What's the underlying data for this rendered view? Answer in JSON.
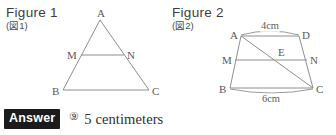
{
  "figures": [
    {
      "id": "figure-1",
      "title": "Figure 1",
      "subtitle": "(図1)",
      "shape": "triangle",
      "points": [
        {
          "name": "A",
          "label": "A",
          "x": 100,
          "y": 20,
          "label_dx": -3,
          "label_dy": -12
        },
        {
          "name": "B",
          "label": "B",
          "x": 63,
          "y": 90,
          "label_dx": -11,
          "label_dy": -4
        },
        {
          "name": "C",
          "label": "C",
          "x": 149,
          "y": 90,
          "label_dx": 3,
          "label_dy": -4
        },
        {
          "name": "M",
          "label": "M",
          "x": 81,
          "y": 55,
          "label_dx": -14,
          "label_dy": -5
        },
        {
          "name": "N",
          "label": "N",
          "x": 124,
          "y": 55,
          "label_dx": 3,
          "label_dy": -5
        }
      ],
      "segments": [
        {
          "name": "side-AB",
          "from": "A",
          "to": "B"
        },
        {
          "name": "side-AC",
          "from": "A",
          "to": "C"
        },
        {
          "name": "side-BC",
          "from": "B",
          "to": "C"
        },
        {
          "name": "midline-MN",
          "from": "M",
          "to": "N"
        }
      ],
      "measures": []
    },
    {
      "id": "figure-2",
      "title": "Figure 2",
      "subtitle": "(図2)",
      "shape": "trapezoid",
      "points": [
        {
          "name": "A",
          "label": "A",
          "x": 241,
          "y": 36,
          "label_dx": -11,
          "label_dy": -6
        },
        {
          "name": "D",
          "label": "D",
          "x": 299,
          "y": 36,
          "label_dx": 3,
          "label_dy": -6
        },
        {
          "name": "B",
          "label": "B",
          "x": 230,
          "y": 88,
          "label_dx": -11,
          "label_dy": -4
        },
        {
          "name": "C",
          "label": "C",
          "x": 313,
          "y": 88,
          "label_dx": 3,
          "label_dy": -4
        },
        {
          "name": "M",
          "label": "M",
          "x": 235,
          "y": 60,
          "label_dx": -13,
          "label_dy": -5
        },
        {
          "name": "N",
          "label": "N",
          "x": 307,
          "y": 60,
          "label_dx": 3,
          "label_dy": -5
        },
        {
          "name": "E",
          "label": "E",
          "x": 281,
          "y": 60,
          "label_dx": -3,
          "label_dy": -13
        }
      ],
      "segments": [
        {
          "name": "side-AD",
          "from": "A",
          "to": "D"
        },
        {
          "name": "side-AB",
          "from": "A",
          "to": "B"
        },
        {
          "name": "side-DC",
          "from": "D",
          "to": "C"
        },
        {
          "name": "side-BC",
          "from": "B",
          "to": "C"
        },
        {
          "name": "midline-MN",
          "from": "M",
          "to": "N"
        },
        {
          "name": "diagonal-AC",
          "from": "A",
          "to": "C"
        }
      ],
      "measures": [
        {
          "name": "measure-AD",
          "text": "4cm",
          "x": 270,
          "y": 26,
          "arc": "top",
          "arc_from": "A",
          "arc_to": "D"
        },
        {
          "name": "measure-BC",
          "text": "6cm",
          "x": 271,
          "y": 99,
          "arc": "bottom",
          "arc_from": "B",
          "arc_to": "C"
        }
      ]
    }
  ],
  "answer": {
    "chip_label": "Answer",
    "marker": "⑨",
    "value": "5 centimeters"
  },
  "style": {
    "line_color": "#8e8e8e",
    "label_color": "#5a5a5a",
    "chip_bg": "#1b1b1b",
    "chip_fg": "#ffffff",
    "answer_text_color": "#2f2f2f",
    "background": "#ffffff"
  }
}
